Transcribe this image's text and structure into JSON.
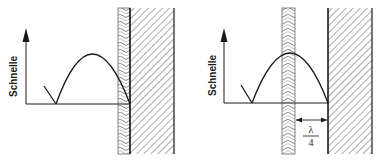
{
  "figure": {
    "panels": [
      {
        "id": "left",
        "axis_label": "Schnelle",
        "description": "Porous absorber directly on wall; velocity maximum away from absorber"
      },
      {
        "id": "right",
        "axis_label": "Schnelle",
        "description": "Porous absorber at distance lambda/4 from wall; absorber at velocity maximum",
        "distance_label": {
          "numerator": "λ",
          "denominator": "4"
        }
      }
    ],
    "colors": {
      "line": "#1a1a1a",
      "background": "#ffffff",
      "hatch": "#555555"
    }
  }
}
